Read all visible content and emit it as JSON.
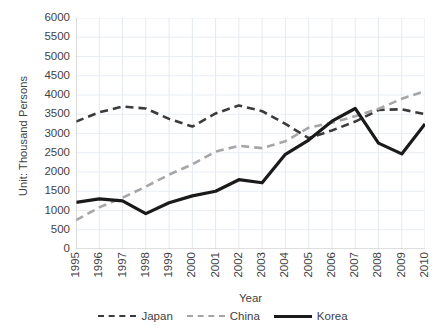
{
  "chart_data": {
    "type": "line",
    "title": "",
    "xlabel": "Year",
    "ylabel": "Unit: Thousand Persons",
    "ylim": [
      0,
      6000
    ],
    "ytick_step": 500,
    "grid": true,
    "legend_position": "bottom",
    "categories": [
      "1995",
      "1996",
      "1997",
      "1998",
      "1999",
      "2000",
      "2001",
      "2002",
      "2003",
      "2004",
      "2005",
      "2006",
      "2007",
      "2008",
      "2009",
      "2010"
    ],
    "yticks": [
      "0",
      "500",
      "1000",
      "1500",
      "2000",
      "2500",
      "3000",
      "3500",
      "4000",
      "4500",
      "5000",
      "5500",
      "6000"
    ],
    "series": [
      {
        "name": "Japan",
        "color": "#3b3b3b",
        "style": "dashed",
        "values": [
          3310,
          3550,
          3700,
          3650,
          3380,
          3180,
          3520,
          3730,
          3580,
          3250,
          2880,
          3080,
          3310,
          3610,
          3630,
          3500
        ]
      },
      {
        "name": "China",
        "color": "#a6a6a6",
        "style": "dashed",
        "values": [
          750,
          1080,
          1330,
          1620,
          1930,
          2200,
          2530,
          2680,
          2620,
          2800,
          3150,
          3280,
          3450,
          3640,
          3900,
          4100
        ]
      },
      {
        "name": "Korea",
        "color": "#1a1a1a",
        "style": "solid",
        "values": [
          1210,
          1300,
          1250,
          920,
          1200,
          1380,
          1500,
          1800,
          1720,
          2460,
          2830,
          3320,
          3650,
          2750,
          2470,
          3250
        ]
      }
    ]
  },
  "legend": {
    "items": [
      {
        "label": "Japan",
        "swatch": "dashed-dark"
      },
      {
        "label": "China",
        "swatch": "dashed-gray"
      },
      {
        "label": "Korea",
        "swatch": "solid-black"
      }
    ]
  },
  "axes": {
    "x_title": "Year",
    "y_title": "Unit: Thousand Persons"
  }
}
